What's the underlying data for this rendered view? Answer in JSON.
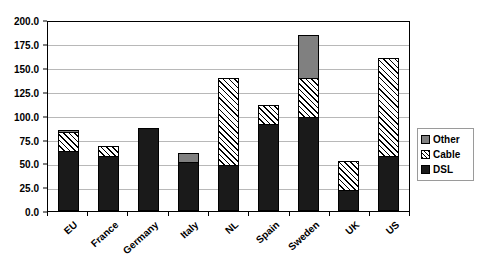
{
  "chart_data": {
    "type": "bar",
    "subtype": "stacked-vertical",
    "title": "",
    "xlabel": "",
    "ylabel": "",
    "ylim": [
      0.0,
      200.0
    ],
    "ytick_step": 25.0,
    "ytick_labels": [
      "200.0",
      "175.0",
      "150.0",
      "125.0",
      "100.0",
      "75.0",
      "50.0",
      "25.0",
      "0.0"
    ],
    "ytick_values": [
      200.0,
      175.0,
      150.0,
      125.0,
      100.0,
      75.0,
      50.0,
      25.0,
      0.0
    ],
    "grid": true,
    "grid_axis": "y",
    "legend_position": "right",
    "categories": [
      "EU",
      "France",
      "Germany",
      "Italy",
      "NL",
      "Spain",
      "Sweden",
      "UK",
      "US"
    ],
    "series": [
      {
        "name": "DSL",
        "color": "#1a1a1a",
        "pattern": "solid-black",
        "values": [
          63,
          58,
          88,
          52,
          49,
          92,
          100,
          22,
          58
        ]
      },
      {
        "name": "Cable",
        "color": "#ffffff",
        "pattern": "diagonal-hatch",
        "values": [
          22,
          12,
          0,
          0,
          93,
          21,
          42,
          32,
          105
        ]
      },
      {
        "name": "Other",
        "color": "#808080",
        "pattern": "solid-gray",
        "values": [
          3,
          0,
          0,
          10,
          0,
          0,
          46,
          0,
          0
        ]
      }
    ],
    "totals": [
      88,
      70,
      88,
      62,
      142,
      113,
      188,
      54,
      163
    ],
    "legend_entries": [
      {
        "label": "Other",
        "swatch": "solid-gray"
      },
      {
        "label": "Cable",
        "swatch": "diagonal-hatch"
      },
      {
        "label": "DSL",
        "swatch": "solid-black"
      }
    ]
  },
  "legend": {
    "other_label": "Other",
    "cable_label": "Cable",
    "dsl_label": "DSL"
  },
  "axis": {
    "y_labels": {
      "t200": "200.0",
      "t175": "175.0",
      "t150": "150.0",
      "t125": "125.0",
      "t100": "100.0",
      "t75": "75.0",
      "t50": "50.0",
      "t25": "25.0",
      "t0": "0.0"
    },
    "x_labels": {
      "c0": "EU",
      "c1": "France",
      "c2": "Germany",
      "c3": "Italy",
      "c4": "NL",
      "c5": "Spain",
      "c6": "Sweden",
      "c7": "UK",
      "c8": "US"
    }
  }
}
